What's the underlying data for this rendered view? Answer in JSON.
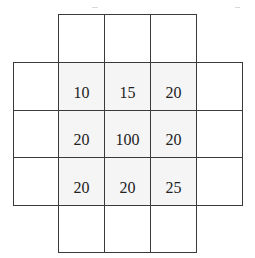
{
  "diagram": {
    "type": "grid-kernel",
    "colors": {
      "line": "#3a3a3a",
      "shaded_fill": "#f5f5f5",
      "empty_fill": "#ffffff",
      "text": "#222222"
    },
    "center_values": [
      [
        "10",
        "15",
        "20"
      ],
      [
        "20",
        "100",
        "20"
      ],
      [
        "20",
        "20",
        "25"
      ]
    ],
    "rows": [
      {
        "name": "top-row",
        "cells": [
          "",
          "",
          ""
        ]
      },
      {
        "name": "row-1",
        "cells": [
          "",
          "10",
          "15",
          "20",
          ""
        ]
      },
      {
        "name": "row-2",
        "cells": [
          "",
          "20",
          "100",
          "20",
          ""
        ]
      },
      {
        "name": "row-3",
        "cells": [
          "",
          "20",
          "20",
          "25",
          ""
        ]
      },
      {
        "name": "bottom-row",
        "cells": [
          "",
          "",
          ""
        ]
      }
    ]
  }
}
